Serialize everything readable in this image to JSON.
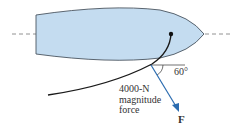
{
  "diagram": {
    "type": "free-body/force diagram",
    "labels": {
      "force_line1": "4000-N",
      "force_line2": "magnitude",
      "force_line3": "force",
      "angle": "60°",
      "force_symbol": "F"
    },
    "colors": {
      "hull_fill": "#c4dcf0",
      "hull_stroke": "#4a5560",
      "rope": "#1a1a1a",
      "force_arrow": "#2b6cb0",
      "centerline": "#777777"
    }
  }
}
